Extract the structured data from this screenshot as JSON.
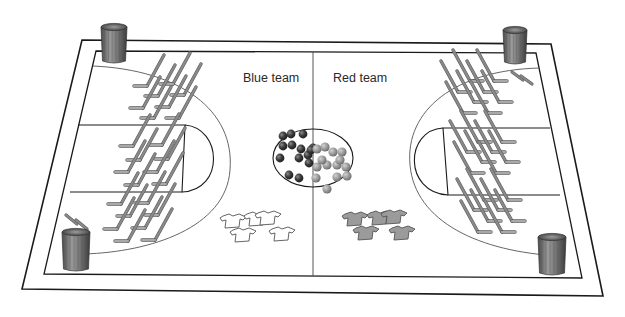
{
  "labels": {
    "left_team": "Blue team",
    "right_team": "Red team"
  },
  "colors": {
    "line": "#1a1a1a",
    "thin_line": "#555555",
    "stick": "#8a8a8a",
    "stick_edge": "#5e5e5e",
    "blue_ball": "#3f3f3f",
    "red_ball": "#9a9a9a",
    "blue_jersey_fill": "#ffffff",
    "red_jersey_fill": "#9b9b9b",
    "can_body": "#7d7d7d"
  },
  "court": {
    "outer": [
      [
        82,
        40
      ],
      [
        551,
        44
      ],
      [
        603,
        296
      ],
      [
        22,
        289
      ]
    ],
    "inner": [
      [
        96,
        51
      ],
      [
        536,
        53
      ],
      [
        582,
        278
      ],
      [
        44,
        274
      ]
    ],
    "center_line_x": 313,
    "center_circle": {
      "cx": 313,
      "cy": 158,
      "rx": 40,
      "ry": 29
    }
  },
  "trash_cans": [
    {
      "name": "trash-can-top-left",
      "x": 101,
      "y": 24,
      "w": 26,
      "h": 40
    },
    {
      "name": "trash-can-top-right",
      "x": 503,
      "y": 27,
      "w": 24,
      "h": 38
    },
    {
      "name": "trash-can-bottom-left",
      "x": 62,
      "y": 229,
      "w": 28,
      "h": 43
    },
    {
      "name": "trash-can-bottom-right",
      "x": 538,
      "y": 234,
      "w": 28,
      "h": 42
    }
  ],
  "balls": {
    "blue_team": [
      [
        283,
        136
      ],
      [
        291,
        134
      ],
      [
        303,
        134
      ],
      [
        283,
        146
      ],
      [
        292,
        145
      ],
      [
        301,
        149
      ],
      [
        280,
        158
      ],
      [
        299,
        158
      ],
      [
        308,
        155
      ],
      [
        313,
        148
      ],
      [
        309,
        163
      ],
      [
        289,
        175
      ],
      [
        299,
        178
      ],
      [
        311,
        150
      ]
    ],
    "red_team": [
      [
        317,
        149
      ],
      [
        325,
        147
      ],
      [
        333,
        152
      ],
      [
        342,
        152
      ],
      [
        317,
        167
      ],
      [
        327,
        165
      ],
      [
        337,
        165
      ],
      [
        346,
        167
      ],
      [
        316,
        178
      ],
      [
        337,
        177
      ],
      [
        347,
        176
      ],
      [
        327,
        189
      ],
      [
        322,
        160
      ],
      [
        340,
        160
      ]
    ]
  },
  "jerseys": {
    "blue_team": [
      [
        223,
        216
      ],
      [
        247,
        214
      ],
      [
        258,
        213
      ],
      [
        233,
        230
      ],
      [
        272,
        229
      ]
    ],
    "red_team": [
      [
        345,
        214
      ],
      [
        370,
        213
      ],
      [
        384,
        212
      ],
      [
        356,
        228
      ],
      [
        392,
        228
      ]
    ]
  },
  "sticks": {
    "left": [
      [
        135,
        86
      ],
      [
        161,
        84
      ],
      [
        146,
        96
      ],
      [
        172,
        95
      ],
      [
        131,
        108
      ],
      [
        157,
        107
      ],
      [
        142,
        118
      ],
      [
        167,
        118
      ],
      [
        121,
        146
      ],
      [
        150,
        145
      ],
      [
        128,
        160
      ],
      [
        156,
        159
      ],
      [
        116,
        172
      ],
      [
        145,
        172
      ],
      [
        126,
        185
      ],
      [
        154,
        184
      ],
      [
        109,
        204
      ],
      [
        136,
        203
      ],
      [
        118,
        216
      ],
      [
        146,
        215
      ],
      [
        105,
        229
      ],
      [
        133,
        228
      ],
      [
        116,
        241
      ],
      [
        143,
        240
      ]
    ],
    "right": [
      [
        462,
        81
      ],
      [
        486,
        81
      ],
      [
        450,
        92
      ],
      [
        476,
        92
      ],
      [
        466,
        102
      ],
      [
        491,
        102
      ],
      [
        455,
        113
      ],
      [
        480,
        113
      ],
      [
        470,
        142
      ],
      [
        494,
        142
      ],
      [
        459,
        152
      ],
      [
        484,
        152
      ],
      [
        474,
        162
      ],
      [
        498,
        162
      ],
      [
        463,
        173
      ],
      [
        488,
        173
      ],
      [
        476,
        200
      ],
      [
        500,
        200
      ],
      [
        466,
        210
      ],
      [
        490,
        210
      ],
      [
        480,
        221
      ],
      [
        504,
        221
      ],
      [
        470,
        232
      ],
      [
        494,
        232
      ]
    ],
    "spare_left": [
      [
        66,
        215
      ],
      [
        76,
        220
      ]
    ],
    "spare_right": [
      [
        512,
        72
      ],
      [
        521,
        76
      ]
    ]
  }
}
